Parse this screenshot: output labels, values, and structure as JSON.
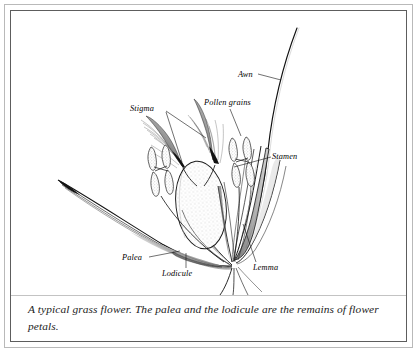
{
  "figure": {
    "type": "botanical-line-drawing",
    "subject": "grass flower",
    "caption": "A typical grass flower. The palea and the lodicule are the remains of flower petals.",
    "background_color": "#ffffff",
    "ink_color": "#000000",
    "outer_border_color": "#b9b9b9",
    "inner_border_color": "#5d5d5d",
    "divider_color": "#c3c3c3"
  },
  "labels": {
    "stigma": "Stigma",
    "pollen_grains": "Pollen grains",
    "awn": "Awn",
    "stamen": "Stamen",
    "palea": "Palea",
    "lodicule": "Lodicule",
    "lemma": "Lemma"
  },
  "parts": {
    "stigma": {
      "name": "Stigma",
      "description": "two feathery plumose stigmas rising from the ovary, dark at the base and fading to fine hairs at the tips"
    },
    "pollen_grains": {
      "name": "Pollen grains",
      "description": "X-shaped stippled anther sacs releasing pollen"
    },
    "awn": {
      "name": "Awn",
      "description": "long slender bristle curving up and to the right from the lemma"
    },
    "stamen": {
      "name": "Stamen",
      "description": "anther borne on a slender filament"
    },
    "palea": {
      "name": "Palea",
      "description": "long narrow pointed bract sweeping to the left, remains of flower petals"
    },
    "lodicule": {
      "name": "Lodicule",
      "description": "small scale at the base of the floret, remains of flower petals"
    },
    "lemma": {
      "name": "Lemma",
      "description": "curved shaded bract on the right bearing the awn"
    },
    "ovary": {
      "name": "Ovary",
      "description": "stippled ovoid body at the centre of the floret"
    }
  }
}
